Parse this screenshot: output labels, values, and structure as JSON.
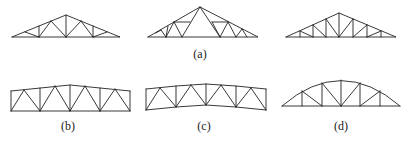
{
  "figure": {
    "labels": {
      "a": "(a)",
      "b": "(b)",
      "c": "(c)",
      "d": "(d)"
    },
    "trusses": [
      {
        "id": "a1",
        "group": "a",
        "type": "triangular pitched truss (Fink/W-type with verticals)"
      },
      {
        "id": "a2",
        "group": "a",
        "type": "triangular pitched truss (compound Fink)"
      },
      {
        "id": "a3",
        "group": "a",
        "type": "triangular pitched truss (Howe-type)"
      },
      {
        "id": "b",
        "group": "b",
        "type": "parallel-chord low-slope truss"
      },
      {
        "id": "c",
        "group": "c",
        "type": "cambered parallel-chord truss"
      },
      {
        "id": "d",
        "group": "d",
        "type": "bowstring (arched) truss"
      }
    ]
  }
}
